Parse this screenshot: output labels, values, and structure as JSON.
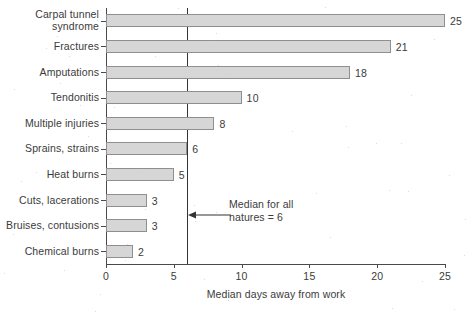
{
  "chart_data": {
    "type": "bar",
    "orientation": "horizontal",
    "title": "",
    "xlabel": "Median days away from work",
    "ylabel": "",
    "xlim": [
      0,
      25
    ],
    "xticks": [
      "0",
      "5",
      "10",
      "15",
      "20",
      "25"
    ],
    "grid": false,
    "legend": "none",
    "categories": [
      "Carpal tunnel syndrome",
      "Fractures",
      "Amputations",
      "Tendonitis",
      "Multiple injuries",
      "Sprains, strains",
      "Heat burns",
      "Cuts, lacerations",
      "Bruises, contusions",
      "Chemical burns"
    ],
    "values": [
      25,
      21,
      18,
      10,
      8,
      6,
      5,
      3,
      3,
      2
    ],
    "data_labels": [
      "25",
      "21",
      "18",
      "10",
      "8",
      "6",
      "5",
      "3",
      "3",
      "2"
    ],
    "annotations": [
      {
        "name": "median-reference",
        "text_line1": "Median for all",
        "text_line2": "natures = 6",
        "value": 6,
        "marker": "vertical-line-with-left-arrow"
      }
    ],
    "colors": {
      "bar_fill": "#d6d6d6",
      "bar_edge": "#8f8f8f",
      "axis": "#4a4a4a",
      "median_line": "#333333",
      "text": "#3b3b3b",
      "background": "#ffffff"
    }
  },
  "labels": {
    "cat0": "Carpal tunnel",
    "cat0b": "syndrome",
    "cat1": "Fractures",
    "cat2": "Amputations",
    "cat3": "Tendonitis",
    "cat4": "Multiple injuries",
    "cat5": "Sprains, strains",
    "cat6": "Heat burns",
    "cat7": "Cuts, lacerations",
    "cat8": "Bruises, contusions",
    "cat9": "Chemical burns"
  }
}
